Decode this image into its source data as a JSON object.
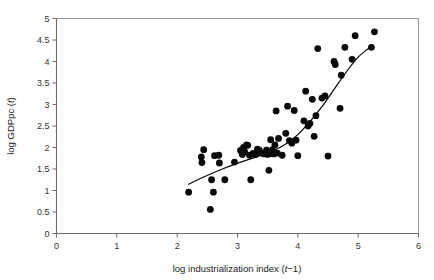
{
  "chart_data": {
    "type": "scatter",
    "title": "",
    "subtitle": "",
    "xlabel_parts": [
      "log industrialization index (",
      "t",
      "−1)"
    ],
    "xlabel": "log industrialization index (t−1)",
    "ylabel_parts": [
      "log GDPpc (",
      "t",
      ")"
    ],
    "ylabel": "log GDPpc (t)",
    "xlim": [
      0,
      6
    ],
    "ylim": [
      0,
      5
    ],
    "xticks": [
      0,
      1,
      2,
      3,
      4,
      5,
      6
    ],
    "xtick_labels": [
      "0",
      "1",
      "2",
      "3",
      "4",
      "5",
      "6"
    ],
    "yticks": [
      0,
      0.5,
      1,
      1.5,
      2,
      2.5,
      3,
      3.5,
      4,
      4.5,
      5
    ],
    "ytick_labels": [
      "0",
      "0.5",
      "1",
      "1.5",
      "2",
      "2.5",
      "3",
      "3.5",
      "4",
      "4.5",
      "5"
    ],
    "grid": false,
    "legend": null,
    "legend_position": "none",
    "marker": {
      "shape": "circle",
      "color": "#0a0a0a",
      "radius_px": 3.4
    },
    "series": [
      {
        "name": "country-year observations",
        "type": "scatter",
        "color": "#0a0a0a",
        "points": [
          [
            2.19,
            0.96
          ],
          [
            2.4,
            1.78
          ],
          [
            2.41,
            1.65
          ],
          [
            2.44,
            1.95
          ],
          [
            2.55,
            0.56
          ],
          [
            2.57,
            1.25
          ],
          [
            2.6,
            0.96
          ],
          [
            2.62,
            1.81
          ],
          [
            2.69,
            1.82
          ],
          [
            2.7,
            1.64
          ],
          [
            2.79,
            1.25
          ],
          [
            2.95,
            1.66
          ],
          [
            3.05,
            1.93
          ],
          [
            3.08,
            1.84
          ],
          [
            3.1,
            2.0
          ],
          [
            3.12,
            1.9
          ],
          [
            3.15,
            2.06
          ],
          [
            3.17,
            2.05
          ],
          [
            3.2,
            1.82
          ],
          [
            3.22,
            1.25
          ],
          [
            3.26,
            1.86
          ],
          [
            3.3,
            1.84
          ],
          [
            3.33,
            1.96
          ],
          [
            3.36,
            1.94
          ],
          [
            3.4,
            1.87
          ],
          [
            3.44,
            1.85
          ],
          [
            3.48,
            1.94
          ],
          [
            3.5,
            1.84
          ],
          [
            3.52,
            1.47
          ],
          [
            3.55,
            2.18
          ],
          [
            3.57,
            1.86
          ],
          [
            3.58,
            1.95
          ],
          [
            3.6,
            1.85
          ],
          [
            3.62,
            2.06
          ],
          [
            3.64,
            2.85
          ],
          [
            3.66,
            1.87
          ],
          [
            3.68,
            2.21
          ],
          [
            3.74,
            1.82
          ],
          [
            3.8,
            2.33
          ],
          [
            3.83,
            2.96
          ],
          [
            3.86,
            2.16
          ],
          [
            3.9,
            2.1
          ],
          [
            3.94,
            2.86
          ],
          [
            3.97,
            2.17
          ],
          [
            4.0,
            1.81
          ],
          [
            4.1,
            2.62
          ],
          [
            4.13,
            3.31
          ],
          [
            4.17,
            2.5
          ],
          [
            4.2,
            2.56
          ],
          [
            4.24,
            3.12
          ],
          [
            4.27,
            2.26
          ],
          [
            4.3,
            2.74
          ],
          [
            4.33,
            4.3
          ],
          [
            4.4,
            3.15
          ],
          [
            4.45,
            3.2
          ],
          [
            4.5,
            1.8
          ],
          [
            4.6,
            4.0
          ],
          [
            4.62,
            3.93
          ],
          [
            4.7,
            2.91
          ],
          [
            4.72,
            3.68
          ],
          [
            4.78,
            4.33
          ],
          [
            4.9,
            4.05
          ],
          [
            4.95,
            4.6
          ],
          [
            5.22,
            4.33
          ],
          [
            5.27,
            4.69
          ]
        ]
      }
    ],
    "fit_line": {
      "name": "fitted regression curve",
      "type": "line",
      "color": "#0a0a0a",
      "points": [
        [
          2.18,
          1.14
        ],
        [
          2.45,
          1.32
        ],
        [
          2.75,
          1.5
        ],
        [
          3.05,
          1.66
        ],
        [
          3.35,
          1.8
        ],
        [
          3.6,
          1.93
        ],
        [
          3.8,
          2.08
        ],
        [
          4.0,
          2.3
        ],
        [
          4.2,
          2.6
        ],
        [
          4.4,
          2.95
        ],
        [
          4.6,
          3.35
        ],
        [
          4.8,
          3.75
        ],
        [
          5.0,
          4.1
        ],
        [
          5.15,
          4.28
        ],
        [
          5.25,
          4.38
        ]
      ]
    }
  },
  "axes": {
    "x_axis_name": "x-axis",
    "y_axis_name": "y-axis"
  }
}
